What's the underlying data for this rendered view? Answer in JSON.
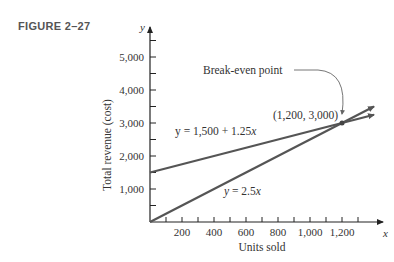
{
  "figure_label": "FIGURE 2–27",
  "chart_data": {
    "type": "line",
    "title": "",
    "xlabel": "Units sold",
    "ylabel": "Total revenue (cost)",
    "x_axis_var": "x",
    "y_axis_var": "y",
    "xlim": [
      0,
      1400
    ],
    "ylim": [
      0,
      5500
    ],
    "x_ticks": [
      200,
      400,
      600,
      800,
      1000,
      1200
    ],
    "x_tick_labels": [
      "200",
      "400",
      "600",
      "800",
      "1,000",
      "1,200"
    ],
    "y_ticks": [
      1000,
      2000,
      3000,
      4000,
      5000
    ],
    "y_tick_labels": [
      "1,000",
      "2,000",
      "3,000",
      "4,000",
      "5,000"
    ],
    "grid": false,
    "series": [
      {
        "name": "y = 1,500 + 1.25x",
        "label_prefix": "y = 1,500 + 1.25",
        "label_var": "x",
        "x": [
          0,
          1400
        ],
        "values": [
          1500,
          3250
        ]
      },
      {
        "name": "y = 2.5x",
        "label_prefix": "y = 2.5",
        "label_var": "x",
        "x": [
          0,
          1400
        ],
        "values": [
          0,
          3500
        ]
      }
    ],
    "annotations": [
      {
        "text": "Break-even point",
        "x": 1200,
        "y": 3000
      },
      {
        "text": "(1,200, 3,000)",
        "x": 1200,
        "y": 3000
      }
    ]
  }
}
